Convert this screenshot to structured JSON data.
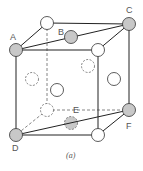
{
  "diagram": {
    "type": "fcc-unit-cell",
    "caption": "(a)",
    "labels": {
      "A": "A",
      "B": "B",
      "C": "C",
      "D": "D",
      "E": "E",
      "F": "F"
    },
    "colors": {
      "line": "#222222",
      "dashed": "#777777",
      "atom_fill": "#ffffff",
      "atom_shaded": "#c8c8c8",
      "label": "#555555"
    }
  }
}
